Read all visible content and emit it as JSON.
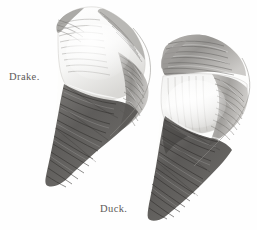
{
  "plate": {
    "background_color": "#fefefe",
    "ink_color": "#5d5a58",
    "width": 257,
    "height": 230
  },
  "figures": [
    {
      "id": "drake",
      "label": "Drake.",
      "label_position": {
        "x": 9,
        "y": 71
      },
      "description": "engraved wing of a drake, pale white coverts above, dark banded primaries below",
      "tones": {
        "covert_light": "#fbfbfa",
        "covert_shadow": "#d8d7d4",
        "speculum": "#8d8b88",
        "primary_dark": "#55535199",
        "primary_darkest": "#3a3836",
        "outline": "#6e6c6a"
      }
    },
    {
      "id": "duck",
      "label": "Duck.",
      "label_position": {
        "x": 100,
        "y": 203
      },
      "description": "engraved wing of a duck, mottled grey scapulars, white mid band, dark banded primaries below",
      "tones": {
        "covert_light": "#f6f6f5",
        "covert_shadow": "#c9c8c5",
        "speculum": "#9b9996",
        "primary_dark": "#5a5856",
        "primary_darkest": "#3d3b39",
        "outline": "#6e6c6a"
      }
    }
  ]
}
